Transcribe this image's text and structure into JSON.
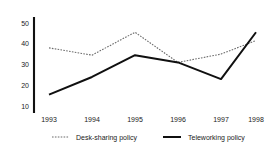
{
  "chart_data": {
    "type": "line",
    "title": "",
    "xlabel": "",
    "ylabel": "",
    "categories": [
      "1993",
      "1994",
      "1995",
      "1996",
      "1997",
      "1998"
    ],
    "yticks": [
      10,
      20,
      30,
      40,
      50
    ],
    "ylim": [
      7,
      53
    ],
    "grid": false,
    "legend_position": "bottom-center",
    "series": [
      {
        "name": "Desk-sharing policy",
        "style": "dotted",
        "color": "#6b6b6b",
        "values": [
          38,
          34.5,
          45.5,
          31,
          35,
          41.5
        ]
      },
      {
        "name": "Teleworking policy",
        "style": "solid",
        "color": "#101010",
        "values": [
          15.5,
          24,
          34.5,
          31,
          23,
          45.5
        ]
      }
    ]
  },
  "axis": {
    "y_tick_labels": [
      "50",
      "40",
      "30",
      "20",
      "10"
    ],
    "x_tick_labels": [
      "1993",
      "1994",
      "1995",
      "1996",
      "1997",
      "1998"
    ]
  },
  "legend": {
    "entries": [
      {
        "label": "Desk-sharing policy",
        "marker": "dotted-line-marker"
      },
      {
        "label": "Teleworking policy",
        "marker": "solid-line-marker"
      }
    ]
  }
}
